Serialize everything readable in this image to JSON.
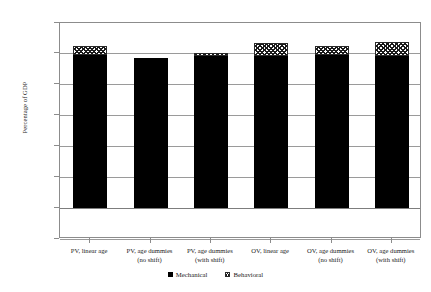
{
  "chart_data": {
    "type": "bar",
    "subtype": "stacked-column",
    "title": "",
    "xlabel": "",
    "ylabel": "Percentage of GDP",
    "ylim": [
      -0.2,
      1.2
    ],
    "ytick_step": 0.2,
    "ytick_labels": [
      "1.20%",
      "1.00%",
      "0.80%",
      "0.60%",
      "0.40%",
      "0.20%",
      "0.00%",
      "-0.20%"
    ],
    "ytick_values": [
      1.2,
      1.0,
      0.8,
      0.6,
      0.4,
      0.2,
      0.0,
      -0.2
    ],
    "grid": true,
    "grid_axis": "y",
    "legend_position": "bottom-center",
    "categories": [
      {
        "line1": "PV, linear age",
        "line2": ""
      },
      {
        "line1": "PV, age dummies",
        "line2": "(no shift)"
      },
      {
        "line1": "PV, age dummies",
        "line2": "(with shift)"
      },
      {
        "line1": "OV, linear age",
        "line2": ""
      },
      {
        "line1": "OV, age dummies",
        "line2": "(no shift)"
      },
      {
        "line1": "OV, age dummies",
        "line2": "(with shift)"
      }
    ],
    "series": [
      {
        "name": "Mechanical",
        "swatch": "solid",
        "color": "#000000",
        "values": [
          0.99,
          0.97,
          0.985,
          0.985,
          0.99,
          0.985
        ]
      },
      {
        "name": "Behavioral",
        "swatch": "hatch",
        "color": "#ffffff",
        "values": [
          0.06,
          0.0,
          0.02,
          0.085,
          0.06,
          0.095
        ]
      }
    ],
    "totals": [
      1.05,
      0.97,
      1.005,
      1.07,
      1.05,
      1.08
    ]
  },
  "legend": {
    "items": [
      {
        "label": "Mechanical",
        "swatch": "solid"
      },
      {
        "label": "Behavioral",
        "swatch": "hatch"
      }
    ]
  },
  "colors": {
    "mechanical": "#000000",
    "behavioral": "#ffffff",
    "gridline": "#9a9a9a",
    "frame": "#8c8c8c",
    "text": "#1a1a1a",
    "background": "#ffffff"
  }
}
